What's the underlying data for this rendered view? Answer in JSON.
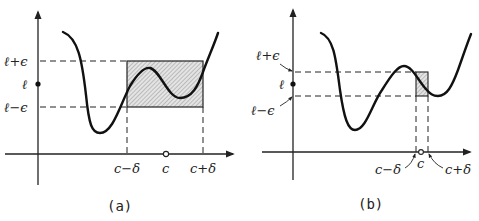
{
  "figure": {
    "colors": {
      "ink": "#222222",
      "hatch_fill": "#d8d8d8",
      "background": "#ffffff"
    },
    "panel_a": {
      "caption": "(a)",
      "y_labels": {
        "upper": "ℓ+ϵ",
        "mid": "ℓ",
        "lower": "ℓ−ϵ"
      },
      "x_labels": {
        "left": "c−δ",
        "center": "c",
        "right": "c+δ"
      }
    },
    "panel_b": {
      "caption": "(b)",
      "y_labels": {
        "upper": "ℓ+ϵ",
        "mid": "ℓ",
        "lower": "ℓ−ϵ"
      },
      "x_labels": {
        "left": "c−δ",
        "center": "c",
        "right": "c+δ"
      }
    }
  }
}
